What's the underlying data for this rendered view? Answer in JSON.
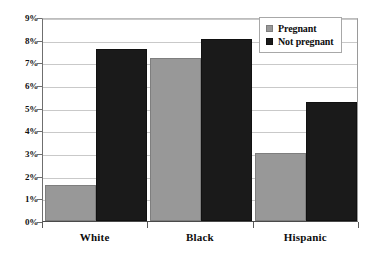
{
  "chart_data": {
    "type": "bar",
    "title": "",
    "subtitle": "",
    "xlabel": "",
    "ylabel": "",
    "categories": [
      "White",
      "Black",
      "Hispanic"
    ],
    "series": [
      {
        "name": "Pregnant",
        "color": "#989898",
        "values": [
          1.6,
          7.2,
          2.98
        ]
      },
      {
        "name": "Not pregnant",
        "color": "#1a1a1a",
        "values": [
          7.6,
          8.05,
          5.25
        ]
      }
    ],
    "ylim": [
      0,
      9
    ],
    "ytick_step": 1,
    "ytick_labels": [
      "0%",
      "1%",
      "2%",
      "3%",
      "4%",
      "5%",
      "6%",
      "7%",
      "8%",
      "9%"
    ],
    "ytick_values": [
      0,
      1,
      2,
      3,
      4,
      5,
      6,
      7,
      8,
      9
    ],
    "grid": "horizontal",
    "legend_position": "top-right",
    "value_suffix": "%"
  },
  "legend": {
    "entries": [
      {
        "label": "Pregnant",
        "swatch": "legend-swatch-pregnant"
      },
      {
        "label": "Not pregnant",
        "swatch": "legend-swatch-not-pregnant"
      }
    ]
  },
  "colors": {
    "pregnant": "#989898",
    "not_pregnant": "#1a1a1a",
    "gridline": "#c9c9c9",
    "axis": "#4a4a4a",
    "background": "#ffffff"
  }
}
